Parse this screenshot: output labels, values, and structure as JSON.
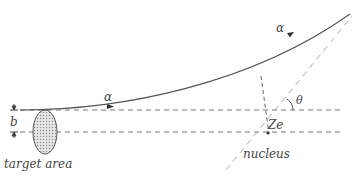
{
  "diagram": {
    "labels": {
      "alpha_incoming": "α",
      "alpha_outgoing": "α",
      "impact_parameter": "b",
      "scattering_angle": "θ",
      "nucleus_charge": "Ze",
      "nucleus": "nucleus",
      "target_area": "target area"
    },
    "colors": {
      "line": "#555555",
      "dashed": "#777777",
      "asymptote": "#aaaaaa",
      "text": "#444444",
      "target_fill": "#cccccc"
    }
  }
}
